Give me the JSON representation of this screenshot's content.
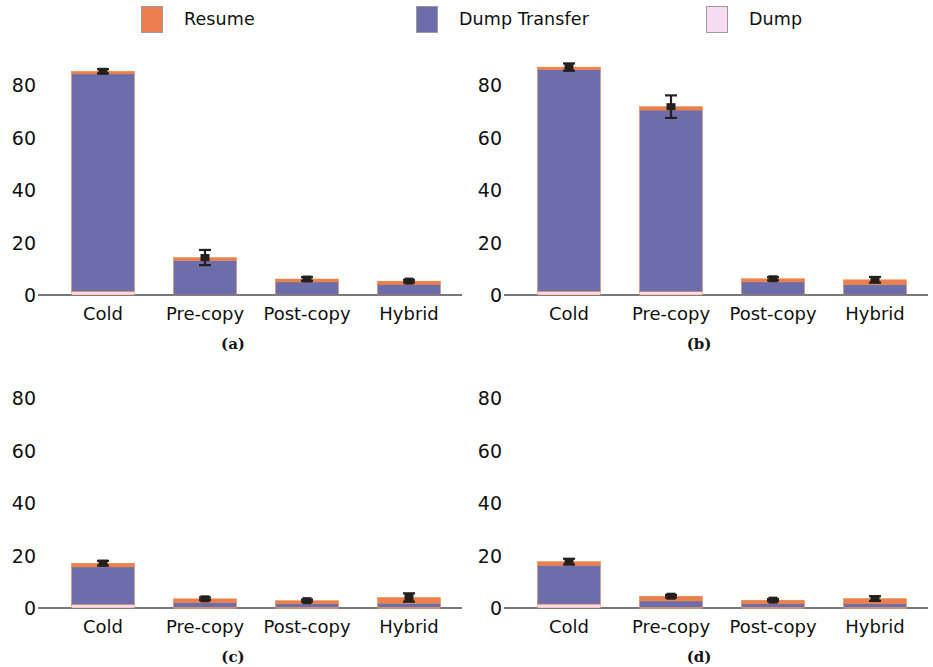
{
  "legend": {
    "entries": [
      {
        "label": "Resume",
        "color": "#ED7F4F",
        "icon": "legend-swatch-resume"
      },
      {
        "label": "Dump Transfer",
        "color": "#6E6DAB",
        "icon": "legend-swatch-dump-transfer"
      },
      {
        "label": "Dump",
        "color": "#F6DBF3",
        "icon": "legend-swatch-dump"
      }
    ]
  },
  "axis": {
    "yticks": [
      "0",
      "20",
      "40",
      "60",
      "80"
    ],
    "ytick_values": [
      0,
      20,
      40,
      60,
      80
    ],
    "ylim": [
      0,
      92
    ],
    "categories": [
      "Cold",
      "Pre-copy",
      "Post-copy",
      "Hybrid"
    ]
  },
  "captions": {
    "a": "(a)",
    "b": "(b)",
    "c": "(c)",
    "d": "(d)"
  },
  "colors": {
    "resume": "#ED7F4F",
    "dump_transfer": "#6E6DAB",
    "dump": "#F6DBF3",
    "axis": "#4A4A52",
    "error": "#241F1C",
    "background": "#FFFFFF"
  },
  "chart_data": [
    {
      "type": "bar",
      "panel": "a",
      "title": "(a)",
      "stacked": true,
      "xlabel": "",
      "ylabel": "",
      "ylim": [
        0,
        92
      ],
      "yticks": [
        0,
        20,
        40,
        60,
        80
      ],
      "grid": false,
      "legend_position": "top",
      "categories": [
        "Cold",
        "Pre-copy",
        "Post-copy",
        "Hybrid"
      ],
      "series": [
        {
          "name": "Dump",
          "color": "#F6DBF3",
          "values": [
            1.4,
            0.0,
            0.0,
            0.0
          ]
        },
        {
          "name": "Dump Transfer",
          "color": "#6E6DAB",
          "values": [
            83.0,
            13.1,
            5.0,
            4.1
          ]
        },
        {
          "name": "Resume",
          "color": "#ED7F4F",
          "values": [
            1.0,
            1.2,
            1.1,
            1.2
          ]
        }
      ],
      "totals": [
        85.4,
        14.3,
        6.1,
        5.3
      ],
      "errors": [
        0.8,
        2.9,
        0.7,
        0.5
      ]
    },
    {
      "type": "bar",
      "panel": "b",
      "title": "(b)",
      "stacked": true,
      "xlabel": "",
      "ylabel": "",
      "ylim": [
        0,
        92
      ],
      "yticks": [
        0,
        20,
        40,
        60,
        80
      ],
      "grid": false,
      "legend_position": "top",
      "categories": [
        "Cold",
        "Pre-copy",
        "Post-copy",
        "Hybrid"
      ],
      "series": [
        {
          "name": "Dump",
          "color": "#F6DBF3",
          "values": [
            1.4,
            1.3,
            0.0,
            0.0
          ]
        },
        {
          "name": "Dump Transfer",
          "color": "#6E6DAB",
          "values": [
            84.6,
            69.3,
            5.0,
            4.0
          ]
        },
        {
          "name": "Resume",
          "color": "#ED7F4F",
          "values": [
            1.0,
            1.3,
            1.2,
            1.8
          ]
        }
      ],
      "totals": [
        87.0,
        71.9,
        6.2,
        5.8
      ],
      "errors": [
        1.4,
        4.3,
        0.6,
        1.1
      ]
    },
    {
      "type": "bar",
      "panel": "c",
      "title": "(c)",
      "stacked": true,
      "xlabel": "",
      "ylabel": "",
      "ylim": [
        0,
        92
      ],
      "yticks": [
        0,
        20,
        40,
        60,
        80
      ],
      "grid": false,
      "legend_position": "top",
      "categories": [
        "Cold",
        "Pre-copy",
        "Post-copy",
        "Hybrid"
      ],
      "series": [
        {
          "name": "Dump",
          "color": "#F6DBF3",
          "values": [
            1.4,
            0.3,
            0.3,
            0.3
          ]
        },
        {
          "name": "Dump Transfer",
          "color": "#6E6DAB",
          "values": [
            14.3,
            1.7,
            1.3,
            1.5
          ]
        },
        {
          "name": "Resume",
          "color": "#ED7F4F",
          "values": [
            1.4,
            1.5,
            1.2,
            2.2
          ]
        }
      ],
      "totals": [
        17.1,
        3.5,
        2.8,
        4.0
      ],
      "errors": [
        0.9,
        0.5,
        0.4,
        1.6
      ]
    },
    {
      "type": "bar",
      "panel": "d",
      "title": "(d)",
      "stacked": true,
      "xlabel": "",
      "ylabel": "",
      "ylim": [
        0,
        92
      ],
      "yticks": [
        0,
        20,
        40,
        60,
        80
      ],
      "grid": false,
      "legend_position": "top",
      "categories": [
        "Cold",
        "Pre-copy",
        "Post-copy",
        "Hybrid"
      ],
      "series": [
        {
          "name": "Dump",
          "color": "#F6DBF3",
          "values": [
            1.5,
            0.3,
            0.3,
            0.3
          ]
        },
        {
          "name": "Dump Transfer",
          "color": "#6E6DAB",
          "values": [
            14.8,
            2.4,
            1.3,
            1.3
          ]
        },
        {
          "name": "Resume",
          "color": "#ED7F4F",
          "values": [
            1.4,
            1.8,
            1.4,
            2.0
          ]
        }
      ],
      "totals": [
        17.7,
        4.5,
        3.0,
        3.6
      ],
      "errors": [
        1.1,
        0.5,
        0.4,
        0.9
      ]
    }
  ]
}
